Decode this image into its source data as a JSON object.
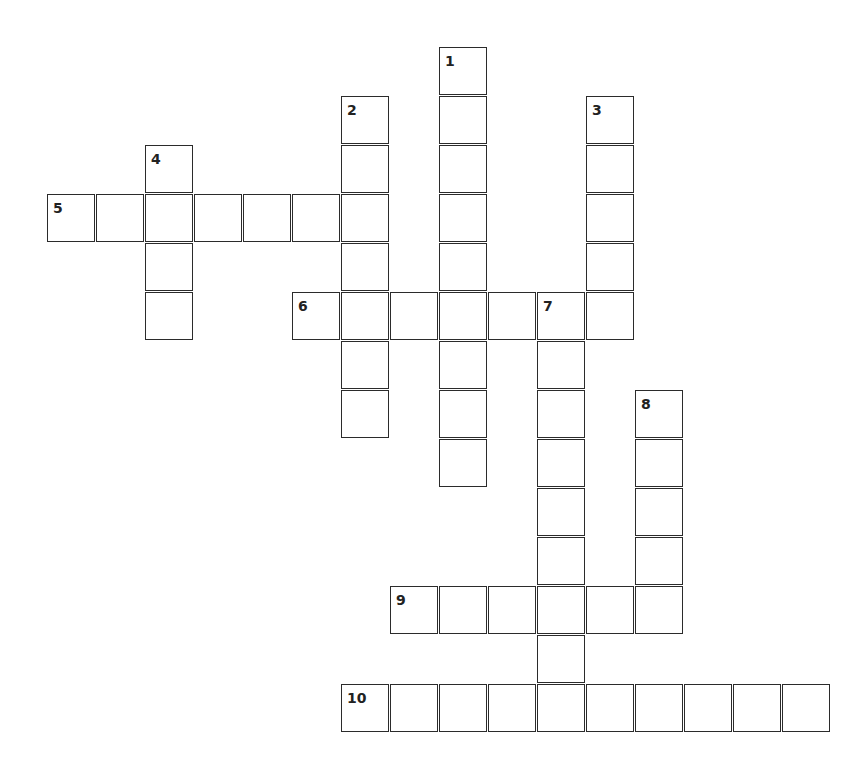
{
  "puzzle": {
    "cell_size": 49,
    "origin_x": 47,
    "origin_y": 47,
    "border_color": "#2b2b2b",
    "words": [
      {
        "number": "1",
        "direction": "down",
        "row": 0,
        "col": 8,
        "length": 9
      },
      {
        "number": "2",
        "direction": "down",
        "row": 1,
        "col": 6,
        "length": 7
      },
      {
        "number": "3",
        "direction": "down",
        "row": 1,
        "col": 11,
        "length": 5
      },
      {
        "number": "4",
        "direction": "down",
        "row": 2,
        "col": 2,
        "length": 4
      },
      {
        "number": "5",
        "direction": "across",
        "row": 3,
        "col": 0,
        "length": 7
      },
      {
        "number": "6",
        "direction": "across",
        "row": 5,
        "col": 5,
        "length": 7
      },
      {
        "number": "7",
        "direction": "down",
        "row": 5,
        "col": 10,
        "length": 9
      },
      {
        "number": "8",
        "direction": "down",
        "row": 7,
        "col": 12,
        "length": 5
      },
      {
        "number": "9",
        "direction": "across",
        "row": 11,
        "col": 7,
        "length": 6
      },
      {
        "number": "10",
        "direction": "across",
        "row": 13,
        "col": 6,
        "length": 10
      }
    ]
  }
}
